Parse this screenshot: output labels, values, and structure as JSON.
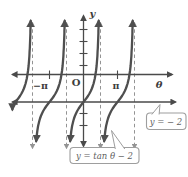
{
  "figure": {
    "background": "#ffffff",
    "axis_color": "#4a4a4a",
    "curve_color": "#4f4f4f",
    "asymptote_color": "#949494",
    "label_color": "#3d3d3d",
    "box_border_color": "#9e9e9e",
    "box_text_color": "#5f5f5f"
  },
  "labels": {
    "y_axis": "y",
    "x_axis": "θ",
    "origin": "O",
    "neg_pi": "−π",
    "pi": "π"
  },
  "callouts": {
    "hline_label": "y = − 2",
    "curve_label": "y = tan θ − 2"
  },
  "chart_data": {
    "type": "line",
    "function": "y = tan(θ) − 2",
    "xlabel": "θ",
    "ylabel": "y",
    "origin_label": "O",
    "x_tick_labels": [
      {
        "theta_over_pi": -1,
        "label": "−π"
      },
      {
        "theta_over_pi": 1,
        "label": "π"
      }
    ],
    "y_axis_ticks_unlabeled": true,
    "branch_centers_theta_over_pi": [
      -2,
      -1,
      0,
      1
    ],
    "asymptotes_theta_over_pi": [
      -1.5,
      -0.5,
      0.5,
      1.5
    ],
    "horizontal_line_y": -2,
    "theta_range_over_pi": [
      -2.1,
      2.65
    ],
    "y_range": [
      -5,
      4.5
    ],
    "grid": false,
    "legend": "none",
    "annotations": [
      "y = − 2",
      "y = tan θ − 2"
    ]
  }
}
